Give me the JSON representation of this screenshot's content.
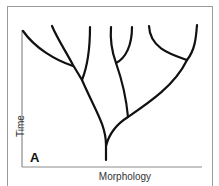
{
  "diagram": {
    "panel_label": "A",
    "axes": {
      "y_label": "Time",
      "x_label": "Morphology"
    },
    "colors": {
      "branch": "#111111",
      "axis": "#8c8c8c",
      "frame": "#9a9a9a",
      "background": "#ffffff"
    },
    "structure": {
      "type": "phylogenetic-tree",
      "root_count": 1,
      "tip_count": 7
    }
  }
}
